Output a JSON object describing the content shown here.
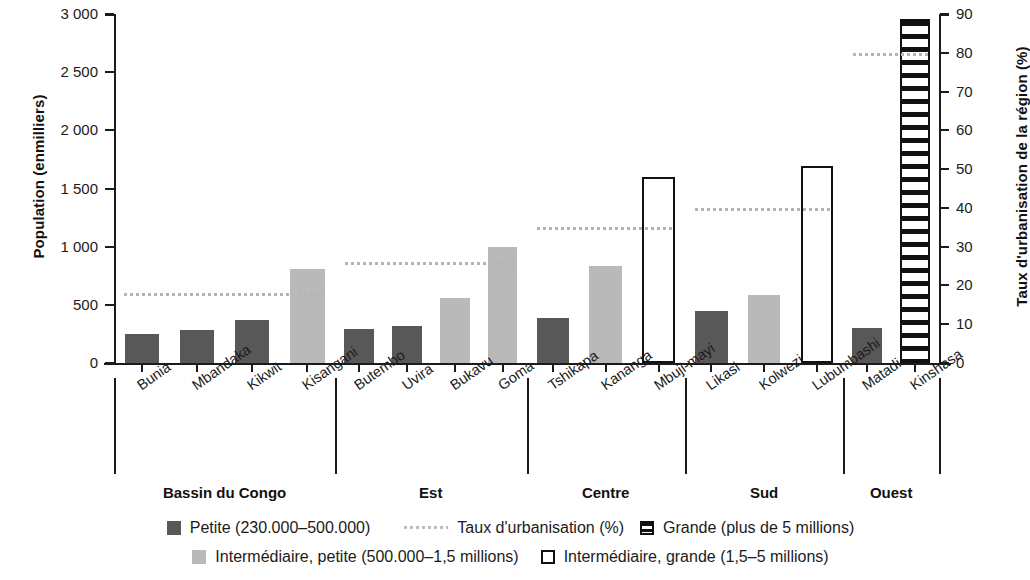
{
  "chart_data": {
    "type": "bar",
    "title": "",
    "ylabel": "Population (enmilliers)",
    "ylabel_right": "Taux d'urbanisation de la région (%)",
    "xlabel": "",
    "ylim": [
      0,
      3000
    ],
    "ylim_right": [
      0,
      90
    ],
    "yticks": [
      "0",
      "500",
      "1 000",
      "1 500",
      "2 000",
      "2 500",
      "3 000"
    ],
    "ytick_values": [
      0,
      500,
      1000,
      1500,
      2000,
      2500,
      3000
    ],
    "yticks_right": [
      "0",
      "10",
      "20",
      "30",
      "40",
      "50",
      "60",
      "70",
      "80",
      "90"
    ],
    "ytick_values_right": [
      0,
      10,
      20,
      30,
      40,
      50,
      60,
      70,
      80,
      90
    ],
    "grid": false,
    "legend_position": "bottom",
    "categories": [
      "Bunia",
      "Mbandaka",
      "Kikwit",
      "Kisangani",
      "Butembo",
      "Uvira",
      "Bukavu",
      "Goma",
      "Tshikapa",
      "Kananga",
      "Mbuji-mayi",
      "Likasi",
      "Kolwezi",
      "Lubumbashi",
      "Matadi",
      "Kinshasa"
    ],
    "values": [
      250,
      280,
      370,
      810,
      290,
      320,
      555,
      1000,
      390,
      830,
      1600,
      450,
      585,
      1690,
      305,
      2960
    ],
    "bar_classes": [
      "petite",
      "petite",
      "petite",
      "inter-petite",
      "petite",
      "petite",
      "inter-petite",
      "inter-petite",
      "petite",
      "inter-petite",
      "inter-grande",
      "petite",
      "inter-petite",
      "inter-grande",
      "petite",
      "grande"
    ],
    "groups": [
      {
        "label": "Bassin du Congo",
        "start": 0,
        "end": 3,
        "urbanisation": 18
      },
      {
        "label": "Est",
        "start": 4,
        "end": 7,
        "urbanisation": 26
      },
      {
        "label": "Centre",
        "start": 8,
        "end": 10,
        "urbanisation": 35
      },
      {
        "label": "Sud",
        "start": 11,
        "end": 13,
        "urbanisation": 40
      },
      {
        "label": "Ouest",
        "start": 14,
        "end": 15,
        "urbanisation": 80
      }
    ],
    "series": [
      {
        "name": "Petite (230.000–500.000)",
        "swatch": "sw-petite"
      },
      {
        "name": "Taux d'urbanisation (%)",
        "swatch": "sw-line"
      },
      {
        "name": "Grande (plus de 5 millions)",
        "swatch": "sw-grande"
      },
      {
        "name": "Intermédiaire, petite (500.000–1,5 millions)",
        "swatch": "sw-inter-petite"
      },
      {
        "name": "Intermédiaire, grande (1,5–5 millions)",
        "swatch": "sw-inter-grande"
      }
    ]
  },
  "legend": {
    "row1": [
      {
        "label": "Petite (230.000–500.000)",
        "swatch": "sw-petite"
      },
      {
        "label": "Taux d'urbanisation (%)",
        "swatch": "sw-line"
      },
      {
        "label": "Grande (plus de 5 millions)",
        "swatch": "sw-grande"
      }
    ],
    "row2": [
      {
        "label": "Intermédiaire, petite (500.000–1,5 millions)",
        "swatch": "sw-inter-petite"
      },
      {
        "label": "Intermédiaire, grande (1,5–5 millions)",
        "swatch": "sw-inter-grande"
      }
    ]
  },
  "colors": {
    "petite": "#585858",
    "intermediaire_petite": "#b9b9b9",
    "outline": "#111111",
    "urbanisation_line": "#b5b5b5",
    "background": "#ffffff"
  }
}
